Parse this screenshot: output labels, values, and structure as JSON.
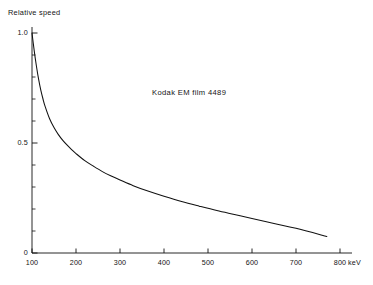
{
  "chart_data": {
    "type": "line",
    "title": "",
    "annotation": "Kodak EM film 4489",
    "xlabel": "",
    "ylabel": "Relative speed",
    "xunit": "keV",
    "xlim": [
      100,
      820
    ],
    "ylim": [
      0,
      1.05
    ],
    "grid": false,
    "legend": null,
    "x_ticks_major": [
      100,
      200,
      300,
      400,
      500,
      600,
      700,
      800
    ],
    "x_tick_labels": [
      "100",
      "200",
      "300",
      "400",
      "500",
      "600",
      "700",
      "800"
    ],
    "y_ticks_major": [
      0,
      0.5,
      1.0
    ],
    "y_tick_labels": [
      "0",
      "0.5",
      "1.0"
    ],
    "y_ticks_minor": [
      0.1,
      0.2,
      0.3,
      0.4,
      0.6,
      0.7,
      0.8,
      0.9
    ],
    "series": [
      {
        "name": "Relative speed vs electron energy",
        "x": [
          100,
          105,
          110,
          115,
          120,
          125,
          130,
          140,
          150,
          160,
          170,
          180,
          190,
          200,
          220,
          240,
          260,
          280,
          300,
          330,
          360,
          400,
          440,
          480,
          520,
          560,
          600,
          650,
          700,
          770
        ],
        "y": [
          1.0,
          0.92,
          0.85,
          0.79,
          0.74,
          0.7,
          0.665,
          0.61,
          0.57,
          0.538,
          0.512,
          0.49,
          0.47,
          0.452,
          0.42,
          0.394,
          0.37,
          0.35,
          0.332,
          0.306,
          0.284,
          0.258,
          0.234,
          0.213,
          0.193,
          0.175,
          0.157,
          0.134,
          0.112,
          0.075
        ]
      }
    ]
  },
  "labels": {
    "ylabel": "Relative speed",
    "xunit": "keV",
    "annotation": "Kodak EM film 4489",
    "caption": ""
  }
}
